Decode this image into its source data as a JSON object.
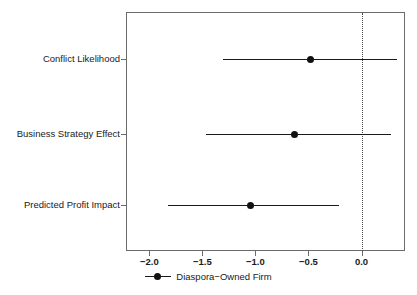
{
  "chart_data": {
    "type": "scatter",
    "title": "",
    "subtitle": "",
    "xlabel": "",
    "ylabel": "",
    "orientation": "horizontal",
    "xlim": [
      -2.22,
      0.41
    ],
    "xticks": [
      -2.0,
      -1.5,
      -1.0,
      -0.5,
      0.0
    ],
    "xticklabels": [
      "−2.0",
      "−1.5",
      "−1.0",
      "−0.5",
      "0.0"
    ],
    "categories": [
      "Conflict Likelihood",
      "Business Strategy Effect",
      "Predicted Profit Impact"
    ],
    "estimates": [
      -0.48,
      -0.63,
      -1.05
    ],
    "ci_low": [
      -1.31,
      -1.47,
      -1.82
    ],
    "ci_high": [
      0.33,
      0.28,
      -0.21
    ],
    "reference_line": 0.0,
    "reference_line_style": "dotted",
    "grid": false,
    "legend": {
      "position": "bottom",
      "entries": [
        {
          "label": "Diaspora−Owned Firm",
          "marker": "circle-with-line",
          "color": "#111111"
        }
      ]
    },
    "series": [
      {
        "name": "Diaspora−Owned Firm",
        "color": "#111111",
        "points": [
          {
            "category": "Conflict Likelihood",
            "estimate": -0.48,
            "low": -1.31,
            "high": 0.33
          },
          {
            "category": "Business Strategy Effect",
            "estimate": -0.63,
            "low": -1.47,
            "high": 0.28
          },
          {
            "category": "Predicted Profit Impact",
            "estimate": -1.05,
            "low": -1.82,
            "high": -0.21
          }
        ]
      }
    ]
  },
  "axes": {
    "x_tick_labels": [
      "−2.0",
      "−1.5",
      "−1.0",
      "−0.5",
      "0.0"
    ],
    "y_tick_labels": [
      "Conflict Likelihood",
      "Business Strategy Effect",
      "Predicted Profit Impact"
    ]
  },
  "legend": {
    "label": "Diaspora−Owned Firm"
  },
  "colors": {
    "marker": "#111111",
    "line": "#1a1a1a",
    "frame": "#6b6b6b",
    "reference": "#4a4a4a",
    "background": "#ffffff"
  }
}
